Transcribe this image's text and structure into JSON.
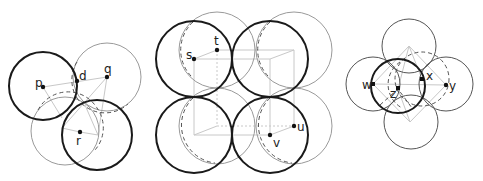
{
  "figures": [
    {
      "id": "left",
      "points": [
        {
          "label": "p",
          "x": 43,
          "y": 87
        },
        {
          "label": "d",
          "x": 77,
          "y": 80
        },
        {
          "label": "q",
          "x": 107,
          "y": 77
        },
        {
          "label": "r",
          "x": 80,
          "y": 132
        }
      ]
    },
    {
      "id": "middle",
      "points": [
        {
          "label": "s",
          "x": 194,
          "y": 59
        },
        {
          "label": "t",
          "x": 217,
          "y": 50
        },
        {
          "label": "u",
          "x": 294,
          "y": 126
        },
        {
          "label": "v",
          "x": 270,
          "y": 135
        }
      ]
    },
    {
      "id": "right",
      "points": [
        {
          "label": "w",
          "x": 373,
          "y": 84
        },
        {
          "label": "z",
          "x": 398,
          "y": 89
        },
        {
          "label": "x",
          "x": 422,
          "y": 79
        },
        {
          "label": "y",
          "x": 446,
          "y": 85
        }
      ]
    }
  ],
  "labels": {
    "p": "p",
    "d": "d",
    "q": "q",
    "r": "r",
    "s": "s",
    "t": "t",
    "u": "u",
    "v": "v",
    "w": "w",
    "x": "x",
    "y": "y",
    "z": "z"
  },
  "colors": {
    "thick_stroke": "#1a1a1a",
    "thin_stroke": "#9a9a9a",
    "guide_stroke": "#c8c8c8"
  }
}
